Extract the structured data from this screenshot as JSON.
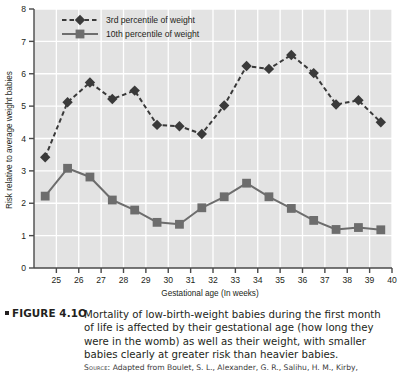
{
  "figure": {
    "bullet": "■",
    "label": "FIGURE 4.1O",
    "caption": "Mortality of low-birth-weight babies during the first month of life is affected by their gestational age (how long they were in the womb) as well as their weight, with smaller babies clearly at greater risk than heavier babies.",
    "source_prefix": "Source:",
    "source_text": "Adapted from Boulet, S. L., Alexander, G. R., Salihu, H. M., Kirby,"
  },
  "chart_data": {
    "type": "line",
    "title": "",
    "xlabel": "Gestational age (In weeks)",
    "ylabel": "Risk relative to average weight babies",
    "xlim": [
      24,
      40
    ],
    "ylim": [
      0,
      8
    ],
    "xticks": [
      25,
      26,
      27,
      28,
      29,
      30,
      31,
      32,
      33,
      34,
      35,
      36,
      37,
      38,
      39,
      40
    ],
    "yticks": [
      0,
      1,
      2,
      3,
      4,
      5,
      6,
      7,
      8
    ],
    "grid": true,
    "legend_position": "top-left",
    "x": [
      24.5,
      25.5,
      26.5,
      27.5,
      28.5,
      29.5,
      30.5,
      31.5,
      32.5,
      33.5,
      34.5,
      35.5,
      36.5,
      37.5,
      38.5,
      39.5
    ],
    "series": [
      {
        "name": "3rd percentile of weight",
        "marker": "diamond",
        "line": "dashed",
        "color": "#3a3a3a",
        "values": [
          3.42,
          5.12,
          5.73,
          5.22,
          5.48,
          4.42,
          4.38,
          4.14,
          5.02,
          6.24,
          6.15,
          6.58,
          6.02,
          5.05,
          5.18,
          4.5
        ]
      },
      {
        "name": "10th percentile of weight",
        "marker": "square",
        "line": "solid",
        "color": "#6d6d6d",
        "values": [
          2.22,
          3.08,
          2.81,
          2.1,
          1.79,
          1.41,
          1.35,
          1.86,
          2.2,
          2.62,
          2.2,
          1.84,
          1.47,
          1.19,
          1.25,
          1.18
        ]
      }
    ]
  },
  "colors": {
    "plot_background": "#e3e3e3",
    "gridline": "#ffffff",
    "axis": "#4a4a4a",
    "series_3rd": "#3a3a3a",
    "series_10th": "#6d6d6d",
    "text": "#231f20"
  }
}
